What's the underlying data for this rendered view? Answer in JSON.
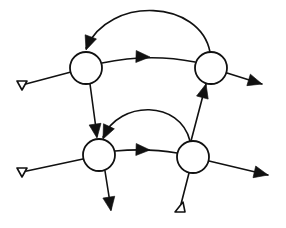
{
  "diagram": {
    "title": "",
    "type": "directed-graph",
    "colors": {
      "stroke": "#111111",
      "node_fill": "#ffffff",
      "background": "#ffffff"
    },
    "nodes": [
      {
        "id": "A",
        "label": "",
        "cx": 86,
        "cy": 68,
        "r": 16
      },
      {
        "id": "B",
        "label": "",
        "cx": 211,
        "cy": 68,
        "r": 16
      },
      {
        "id": "C",
        "label": "",
        "cx": 99,
        "cy": 155,
        "r": 16
      },
      {
        "id": "D",
        "label": "",
        "cx": 193,
        "cy": 157,
        "r": 16
      }
    ],
    "edges": [
      {
        "id": "inA",
        "from": "input",
        "to": "A",
        "kind": "input-terminal",
        "path": "M 22 85 L 71 72",
        "terminal": "22,85"
      },
      {
        "id": "inC",
        "from": "input",
        "to": "C",
        "kind": "input-terminal",
        "path": "M 22 172 L 83 159",
        "terminal": "22,172"
      },
      {
        "id": "inD",
        "from": "input",
        "to": "D",
        "kind": "input-terminal",
        "path": "M 180 208 L 189 173",
        "terminal": "180,208"
      },
      {
        "id": "AB",
        "from": "A",
        "to": "B",
        "kind": "arrow",
        "path": "M 102 63 Q 150 53 195 62",
        "arrow_at": [
          150,
          57
        ],
        "arrow_angle": 2
      },
      {
        "id": "CD",
        "from": "C",
        "to": "D",
        "kind": "arrow",
        "path": "M 115 151 Q 148 148 177 153",
        "arrow_at": [
          150,
          150
        ],
        "arrow_angle": 2
      },
      {
        "id": "AC",
        "from": "A",
        "to": "C",
        "kind": "arrow",
        "path": "M 90 84 L 97 136",
        "arrow_at": [
          97,
          138
        ],
        "arrow_angle": 82
      },
      {
        "id": "DB",
        "from": "D",
        "to": "B",
        "kind": "arrow",
        "path": "M 191 141 L 206 84",
        "arrow_at": [
          206,
          84
        ],
        "arrow_angle": -75
      },
      {
        "id": "BA",
        "from": "B",
        "to": "A",
        "kind": "feedback-arc",
        "path": "M 210 52 C 200 0 110 -5 86 48",
        "arrow_at": [
          86,
          50
        ],
        "arrow_angle": 110
      },
      {
        "id": "DC",
        "from": "D",
        "to": "C",
        "kind": "feedback-arc",
        "path": "M 190 141 C 180 100 120 100 103 137",
        "arrow_at": [
          103,
          139
        ],
        "arrow_angle": 115
      },
      {
        "id": "Bout",
        "from": "B",
        "to": "output",
        "kind": "arrow",
        "path": "M 227 73 L 262 84",
        "arrow_at": [
          262,
          84
        ],
        "arrow_angle": 17
      },
      {
        "id": "Dout",
        "from": "D",
        "to": "output",
        "kind": "arrow",
        "path": "M 209 161 L 268 175",
        "arrow_at": [
          268,
          175
        ],
        "arrow_angle": 13
      },
      {
        "id": "Cout",
        "from": "C",
        "to": "output",
        "kind": "arrow",
        "path": "M 105 171 L 111 209",
        "arrow_at": [
          111,
          211
        ],
        "arrow_angle": 81
      }
    ]
  }
}
